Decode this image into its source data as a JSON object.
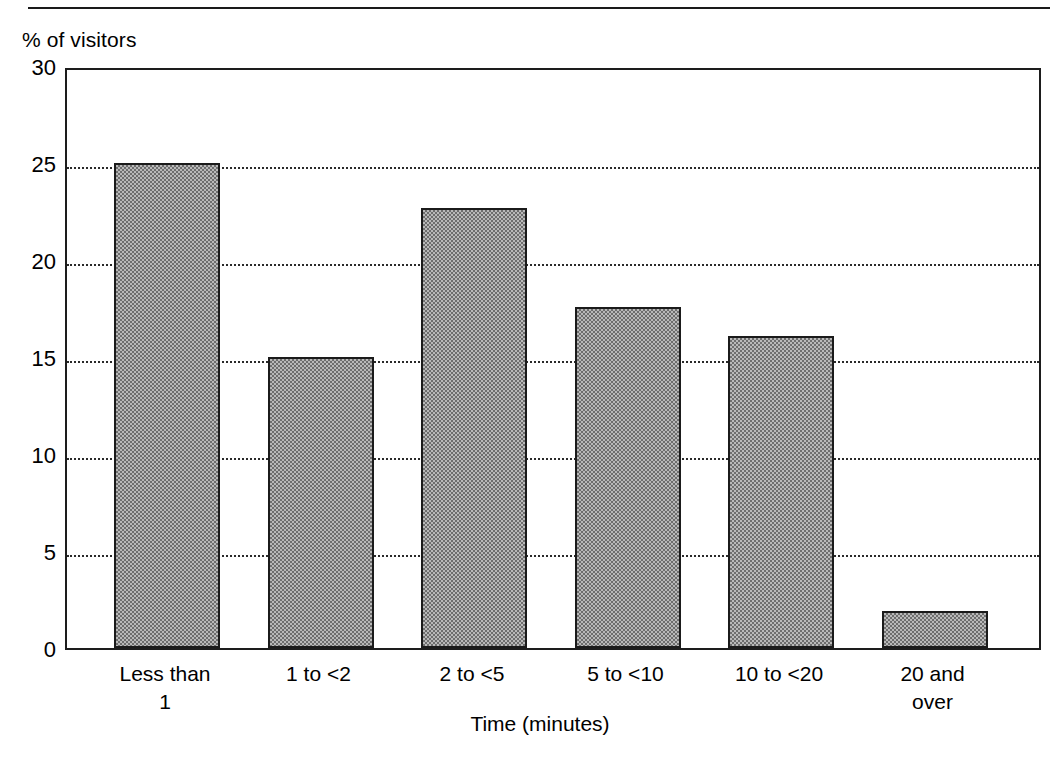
{
  "chart_data": {
    "type": "bar",
    "title": "",
    "subtitle": "",
    "ylabel": "% of visitors",
    "xlabel": "Time (minutes)",
    "categories": [
      "Less than 1",
      "1 to <2",
      "2 to <5",
      "5 to <10",
      "10 to <20",
      "20 and over"
    ],
    "category_lines": [
      [
        "Less than",
        "1"
      ],
      [
        "1 to <2"
      ],
      [
        "2 to <5"
      ],
      [
        "5 to <10"
      ],
      [
        "10 to <20"
      ],
      [
        "20 and",
        "over"
      ]
    ],
    "values": [
      25.0,
      15.0,
      22.7,
      17.6,
      16.1,
      1.9
    ],
    "ylim": [
      0,
      30
    ],
    "y_ticks": [
      0,
      5,
      10,
      15,
      20,
      25,
      30
    ],
    "y_tick_labels": [
      "0",
      "5",
      "10",
      "15",
      "20",
      "25",
      "30"
    ],
    "gridlines": [
      5,
      10,
      15,
      20,
      25
    ],
    "grid": true,
    "legend": null,
    "legend_position": "none",
    "bar_fill": "#b9b9b9",
    "bar_edge": "#1b1b1b",
    "axis_color": "#1d1d1d",
    "grid_color": "#2a2a2a",
    "background": "#ffffff"
  }
}
